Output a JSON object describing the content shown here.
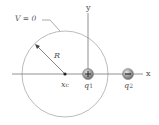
{
  "diagram": {
    "equipotential_label": "V = 0",
    "radius_label": "R",
    "center_label": "x",
    "center_subscript": "c",
    "x_axis_label": "x",
    "y_axis_label": "y",
    "charges": [
      {
        "label": "q",
        "subscript": "1",
        "sign": "+",
        "x": 88,
        "y": 74
      },
      {
        "label": "q",
        "subscript": "2",
        "sign": "−",
        "x": 128,
        "y": 74
      }
    ],
    "circle": {
      "cx": 65,
      "cy": 74,
      "r": 43
    }
  }
}
